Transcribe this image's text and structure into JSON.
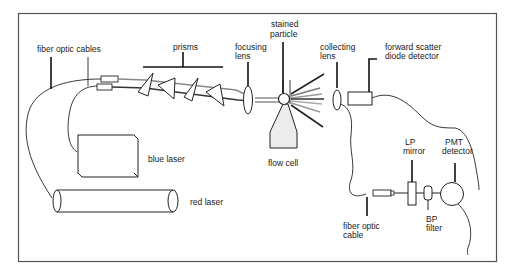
{
  "diagram": {
    "frame": {
      "x": 18,
      "y": 13,
      "width": 479,
      "height": 249,
      "stroke": "#555555"
    },
    "labels": {
      "fiber_optic_cables": "fiber optic cables",
      "prisms": "prisms",
      "focusing_lens_1": "focusing",
      "focusing_lens_2": "lens",
      "stained_particle_1": "stained",
      "stained_particle_2": "particle",
      "collecting_lens_1": "collecting",
      "collecting_lens_2": "lens",
      "forward_scatter_1": "forward scatter",
      "forward_scatter_2": "diode detector",
      "blue_laser": "blue laser",
      "red_laser": "red laser",
      "flow_cell": "flow cell",
      "lp_mirror_1": "LP",
      "lp_mirror_2": "mirror",
      "pmt_detector_1": "PMT",
      "pmt_detector_2": "detector",
      "fiber_optic_cable_1": "fiber optic",
      "fiber_optic_cable_2": "cable",
      "bp_filter_1": "BP",
      "bp_filter_2": "filter"
    },
    "components": [
      {
        "id": "blue-laser",
        "name": "blue laser",
        "shape": "box"
      },
      {
        "id": "red-laser",
        "name": "red laser",
        "shape": "cylinder"
      },
      {
        "id": "fiber-optic-cables",
        "name": "fiber optic cables",
        "count": 2
      },
      {
        "id": "prisms",
        "name": "prisms",
        "count": 4
      },
      {
        "id": "focusing-lens",
        "name": "focusing lens"
      },
      {
        "id": "stained-particle",
        "name": "stained particle"
      },
      {
        "id": "flow-cell",
        "name": "flow cell"
      },
      {
        "id": "collecting-lens",
        "name": "collecting lens"
      },
      {
        "id": "forward-scatter-detector",
        "name": "forward scatter diode detector"
      },
      {
        "id": "fiber-optic-cable",
        "name": "fiber optic cable"
      },
      {
        "id": "lp-mirror",
        "name": "LP mirror"
      },
      {
        "id": "bp-filter",
        "name": "BP filter"
      },
      {
        "id": "pmt-detector",
        "name": "PMT detector"
      }
    ],
    "colors": {
      "line": "#222222",
      "frame": "#555555",
      "flow_cell_fill": "#ececec",
      "scatter_light": "#9a9a9a"
    }
  }
}
